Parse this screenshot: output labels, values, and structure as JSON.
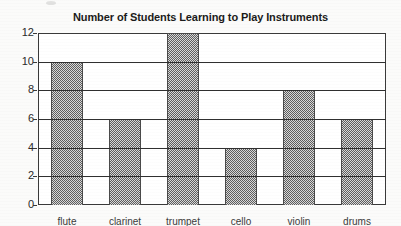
{
  "chart_data": {
    "type": "bar",
    "title": "Number of Students Learning to Play Instruments",
    "xlabel": "",
    "ylabel": "",
    "categories": [
      "flute",
      "clarinet",
      "trumpet",
      "cello",
      "violin",
      "drums"
    ],
    "values": [
      10,
      6,
      12,
      4,
      8,
      6
    ],
    "ylim": [
      0,
      12
    ],
    "yticks": [
      0,
      2,
      4,
      6,
      8,
      10,
      12
    ],
    "ytick_labels": [
      "0",
      "2",
      "4",
      "6",
      "8",
      "10",
      "12"
    ],
    "grid": true,
    "legend": false,
    "bar_color": "#8b8b8b",
    "frame_color": "#3a3a3a",
    "background_color": "#ffffff",
    "note": "x-axis category labels are cropped by the bottom edge of the screenshot"
  }
}
